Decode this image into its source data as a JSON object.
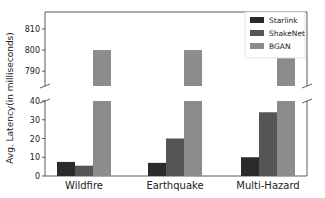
{
  "chart_data": {
    "type": "bar",
    "title": "",
    "xlabel": "",
    "ylabel": "Avg. Latency(in milliseconds)",
    "categories": [
      "Wildfire",
      "Earthquake",
      "Multi-Hazard"
    ],
    "series": [
      {
        "name": "Starlink",
        "color": "#2b2b2b",
        "values": [
          7.5,
          7,
          10
        ]
      },
      {
        "name": "ShakeNet",
        "color": "#555555",
        "values": [
          5.5,
          20,
          34
        ]
      },
      {
        "name": "BGAN",
        "color": "#8c8c8c",
        "values": [
          800,
          800,
          800
        ]
      }
    ],
    "broken_axis": true,
    "upper_ylim": [
      783,
      818
    ],
    "lower_ylim": [
      0,
      40
    ],
    "upper_ticks": [
      790,
      800,
      810
    ],
    "lower_ticks": [
      0,
      10,
      20,
      30,
      40
    ],
    "legend_position": "upper right",
    "grid": false
  }
}
